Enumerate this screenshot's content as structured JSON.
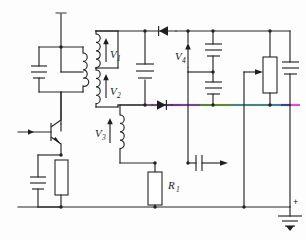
{
  "diagram": {
    "type": "circuit-schematic",
    "canvas": {
      "width": 306,
      "height": 240,
      "background": "#fdfdfd"
    },
    "line_color": "#262626"
  },
  "labels": {
    "v1": "V",
    "v1_sub": "1",
    "v2": "V",
    "v2_sub": "2",
    "v3": "V",
    "v3_sub": "3",
    "v4": "V",
    "v4_sub": "4",
    "r1": "R",
    "r1_sub": "1",
    "ground_plus": "+"
  },
  "components": [
    {
      "name": "tank-capacitor",
      "type": "capacitor"
    },
    {
      "name": "tank-inductor",
      "type": "inductor"
    },
    {
      "name": "transformer-primary-v1",
      "type": "inductor"
    },
    {
      "name": "transformer-winding-v2",
      "type": "inductor"
    },
    {
      "name": "transformer-winding-v3",
      "type": "inductor"
    },
    {
      "name": "npn-transistor",
      "type": "transistor-npn"
    },
    {
      "name": "emitter-capacitor",
      "type": "capacitor"
    },
    {
      "name": "emitter-resistor",
      "type": "resistor"
    },
    {
      "name": "resistor-r1",
      "type": "resistor"
    },
    {
      "name": "diode-top",
      "type": "diode",
      "direction": "left"
    },
    {
      "name": "diode-bottom",
      "type": "diode",
      "direction": "right"
    },
    {
      "name": "capacitor-c-left",
      "type": "capacitor"
    },
    {
      "name": "capacitor-c-upper",
      "type": "capacitor"
    },
    {
      "name": "capacitor-c-lower",
      "type": "capacitor"
    },
    {
      "name": "capacitor-c-right",
      "type": "capacitor"
    },
    {
      "name": "coupling-capacitor",
      "type": "capacitor"
    },
    {
      "name": "potentiometer",
      "type": "potentiometer"
    },
    {
      "name": "ground",
      "type": "earth-ground"
    }
  ],
  "highlight": {
    "name": "rainbow-trace",
    "y": 105,
    "stops": [
      {
        "x1": 120,
        "x2": 146,
        "color": "#3a3a3a"
      },
      {
        "x1": 146,
        "x2": 163,
        "color": "#d17fe0"
      },
      {
        "x1": 163,
        "x2": 181,
        "color": "#b84fd6"
      },
      {
        "x1": 181,
        "x2": 200,
        "color": "#c06ce0"
      },
      {
        "x1": 200,
        "x2": 213,
        "color": "#86e04a"
      },
      {
        "x1": 213,
        "x2": 232,
        "color": "#9ae84f"
      },
      {
        "x1": 232,
        "x2": 262,
        "color": "#74dbe8"
      },
      {
        "x1": 262,
        "x2": 281,
        "color": "#6fd4ee"
      },
      {
        "x1": 281,
        "x2": 290,
        "color": "#5a5fd6"
      },
      {
        "x1": 290,
        "x2": 306,
        "color": "#d552d8"
      }
    ]
  }
}
